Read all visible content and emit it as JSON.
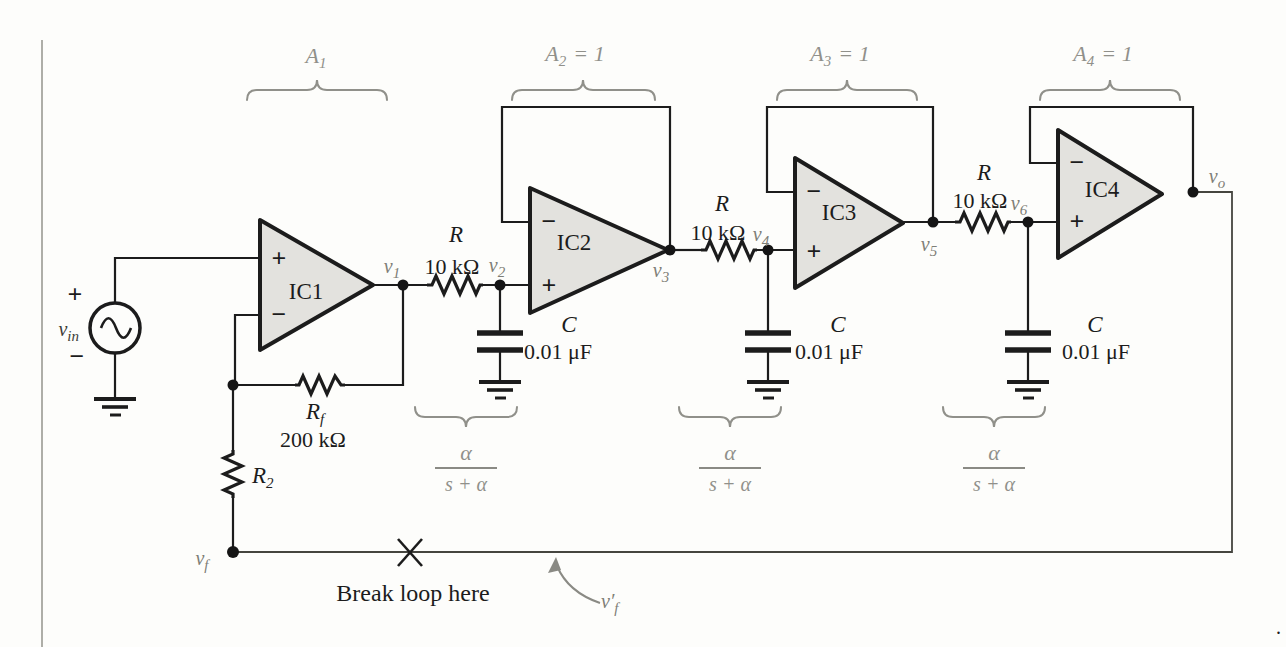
{
  "colors": {
    "opamp_fill": "#e3e2de",
    "ink": "#1c1c1c",
    "annotation_gray": "#90908a",
    "node_label_gray": "#7e7e76",
    "background": "#fdfdfb"
  },
  "gains": [
    {
      "base": "A",
      "sub": "1",
      "rest": ""
    },
    {
      "base": "A",
      "sub": "2",
      "rest": "= 1"
    },
    {
      "base": "A",
      "sub": "3",
      "rest": "= 1"
    },
    {
      "base": "A",
      "sub": "4",
      "rest": "= 1"
    }
  ],
  "opamps": [
    {
      "label": "IC1",
      "top_sign": "+",
      "bottom_sign": "−"
    },
    {
      "label": "IC2",
      "top_sign": "−",
      "bottom_sign": "+"
    },
    {
      "label": "IC3",
      "top_sign": "−",
      "bottom_sign": "+"
    },
    {
      "label": "IC4",
      "top_sign": "−",
      "bottom_sign": "+"
    }
  ],
  "source": {
    "label_base": "v",
    "label_sub": "in",
    "plus": "+",
    "minus": "−"
  },
  "nodes": {
    "v1": {
      "base": "v",
      "sub": "1"
    },
    "v2": {
      "base": "v",
      "sub": "2"
    },
    "v3": {
      "base": "v",
      "sub": "3"
    },
    "v4": {
      "base": "v",
      "sub": "4"
    },
    "v5": {
      "base": "v",
      "sub": "5"
    },
    "v6": {
      "base": "v",
      "sub": "6"
    },
    "vo": {
      "base": "v",
      "sub": "o"
    },
    "vf": {
      "base": "v",
      "sub": "f"
    },
    "vf_prime": {
      "base": "v′",
      "sub": "f"
    }
  },
  "rc_stages": [
    {
      "r_label": "R",
      "r_value": "10 kΩ",
      "c_label": "C",
      "c_value": "0.01 μF"
    },
    {
      "r_label": "R",
      "r_value": "10 kΩ",
      "c_label": "C",
      "c_value": "0.01 μF"
    },
    {
      "r_label": "R",
      "r_value": "10 kΩ",
      "c_label": "C",
      "c_value": "0.01 μF"
    }
  ],
  "feedback_network": {
    "rf_base": "R",
    "rf_sub": "f",
    "rf_value": "200 kΩ",
    "r2_base": "R",
    "r2_sub": "2"
  },
  "transfer_functions": [
    {
      "num": "α",
      "den": "s + α"
    },
    {
      "num": "α",
      "den": "s + α"
    },
    {
      "num": "α",
      "den": "s + α"
    }
  ],
  "break_note": "Break loop here",
  "footnote": "."
}
